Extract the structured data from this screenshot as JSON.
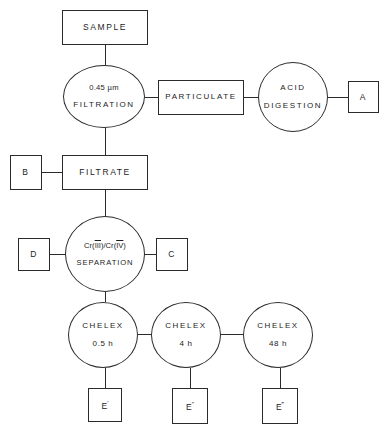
{
  "diagram": {
    "line_color": "#2b2b2b",
    "text_color": "#1d1d1d",
    "background": "#ffffff"
  },
  "nodes": {
    "sample": {
      "label": "SAMPLE",
      "shape": "rect"
    },
    "filtration": {
      "line1": "0.45 µm",
      "line2": "FILTRATION",
      "shape": "circle"
    },
    "particulate": {
      "label": "PARTICULATE",
      "shape": "rect"
    },
    "acid_digestion": {
      "line1": "ACID",
      "line2": "DIGESTION",
      "shape": "circle"
    },
    "a": {
      "label": "A",
      "shape": "rect"
    },
    "b": {
      "label": "B",
      "shape": "rect"
    },
    "filtrate": {
      "label": "FILTRATE",
      "shape": "rect"
    },
    "d": {
      "label": "D",
      "shape": "rect"
    },
    "separation": {
      "line1_prefix": "Cr(",
      "line1_num1": "III",
      "line1_middle": ")/Cr(",
      "line1_num2": "IV",
      "line1_suffix": ")",
      "line1_plain": "Cr(III)/Cr(IV)",
      "line2": "SEPARATION",
      "shape": "circle"
    },
    "c": {
      "label": "C",
      "shape": "rect"
    },
    "chelex_05": {
      "line1": "CHELEX",
      "line2": "0.5 h",
      "shape": "circle"
    },
    "chelex_4": {
      "line1": "CHELEX",
      "line2": "4 h",
      "shape": "circle"
    },
    "chelex_48": {
      "line1": "CHELEX",
      "line2": "48 h",
      "shape": "circle"
    },
    "e1": {
      "label": "E",
      "primes": "′",
      "shape": "rect"
    },
    "e2": {
      "label": "E",
      "primes": "″",
      "shape": "rect"
    },
    "e3": {
      "label": "E",
      "primes": "‴",
      "shape": "rect"
    }
  }
}
